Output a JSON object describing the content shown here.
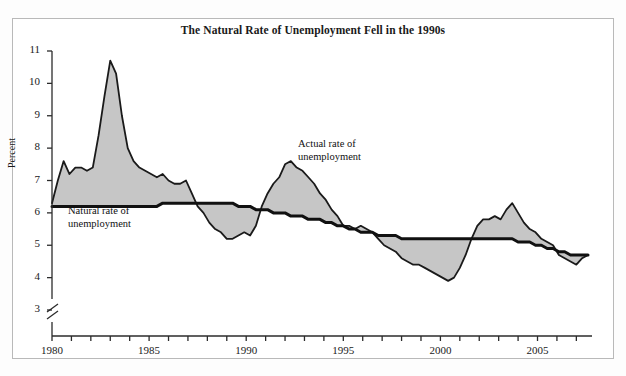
{
  "figure": {
    "width": 626,
    "height": 376,
    "background": "#fdfdfd",
    "border_color": "#b9b9b9"
  },
  "title": "The Natural Rate of Unemployment Fell in the 1990s",
  "axes": {
    "ylabel": "Percent",
    "y_ticks": [
      3,
      4,
      5,
      6,
      7,
      8,
      9,
      10,
      11
    ],
    "y_tick_labels": [
      "3",
      "4",
      "5",
      "6",
      "7",
      "8",
      "9",
      "10",
      "11"
    ],
    "ylim": [
      3,
      11
    ],
    "axis_break": true,
    "x_ticks": [
      1980,
      1981,
      1982,
      1983,
      1984,
      1985,
      1986,
      1987,
      1988,
      1989,
      1990,
      1991,
      1992,
      1993,
      1994,
      1995,
      1996,
      1997,
      1998,
      1999,
      2000,
      2001,
      2002,
      2003,
      2004,
      2005,
      2006,
      2007
    ],
    "x_tick_labels": [
      "1980",
      "1985",
      "1990",
      "1995",
      "2000",
      "2005"
    ],
    "x_labeled_ticks": [
      1980,
      1985,
      1990,
      1995,
      2000,
      2005
    ],
    "xlim": [
      1980,
      2007.6
    ],
    "grid": false
  },
  "annotations": [
    {
      "name": "natural-rate-label",
      "text": "Natural rate of\nunemployment",
      "x": 68,
      "y": 205
    },
    {
      "name": "actual-rate-label",
      "text": "Actual rate of\nunemployment",
      "x": 298,
      "y": 138
    }
  ],
  "colors": {
    "line": "#111111",
    "fill": "#c6c6c6",
    "fill_edge": "#1a1a1a",
    "axis": "#2b2b2b",
    "text": "#1a1a1a"
  },
  "chart_data": {
    "type": "area",
    "title": "The Natural Rate of Unemployment Fell in the 1990s",
    "xlabel": "",
    "ylabel": "Percent",
    "ylim": [
      3,
      11
    ],
    "xlim": [
      1980,
      2007.6
    ],
    "grid": false,
    "legend_position": "inline-annotations",
    "x": [
      1980.0,
      1980.3,
      1980.6,
      1980.9,
      1981.2,
      1981.5,
      1981.8,
      1982.1,
      1982.4,
      1982.7,
      1983.0,
      1983.3,
      1983.6,
      1983.9,
      1984.2,
      1984.5,
      1984.8,
      1985.1,
      1985.4,
      1985.7,
      1986.0,
      1986.3,
      1986.6,
      1986.9,
      1987.2,
      1987.5,
      1987.8,
      1988.1,
      1988.4,
      1988.7,
      1989.0,
      1989.3,
      1989.6,
      1989.9,
      1990.2,
      1990.5,
      1990.8,
      1991.1,
      1991.4,
      1991.7,
      1992.0,
      1992.3,
      1992.6,
      1992.9,
      1993.2,
      1993.5,
      1993.8,
      1994.1,
      1994.4,
      1994.7,
      1995.0,
      1995.3,
      1995.6,
      1995.9,
      1996.2,
      1996.5,
      1996.8,
      1997.1,
      1997.4,
      1997.7,
      1998.0,
      1998.3,
      1998.6,
      1998.9,
      1999.2,
      1999.5,
      1999.8,
      2000.1,
      2000.4,
      2000.7,
      2001.0,
      2001.3,
      2001.6,
      2001.9,
      2002.2,
      2002.5,
      2002.8,
      2003.1,
      2003.4,
      2003.7,
      2004.0,
      2004.3,
      2004.6,
      2004.9,
      2005.2,
      2005.5,
      2005.8,
      2006.1,
      2006.4,
      2006.7,
      2007.0,
      2007.3,
      2007.6
    ],
    "series": [
      {
        "name": "Actual rate of unemployment",
        "values": [
          6.3,
          7.0,
          7.6,
          7.2,
          7.4,
          7.4,
          7.3,
          7.4,
          8.4,
          9.6,
          10.7,
          10.3,
          9.0,
          8.0,
          7.6,
          7.4,
          7.3,
          7.2,
          7.1,
          7.2,
          7.0,
          6.9,
          6.9,
          7.0,
          6.6,
          6.2,
          6.0,
          5.7,
          5.5,
          5.4,
          5.2,
          5.2,
          5.3,
          5.4,
          5.3,
          5.6,
          6.2,
          6.6,
          6.9,
          7.1,
          7.5,
          7.6,
          7.4,
          7.3,
          7.1,
          6.9,
          6.6,
          6.4,
          6.1,
          5.9,
          5.6,
          5.6,
          5.5,
          5.6,
          5.5,
          5.4,
          5.2,
          5.0,
          4.9,
          4.8,
          4.6,
          4.5,
          4.4,
          4.4,
          4.3,
          4.2,
          4.1,
          4.0,
          3.9,
          4.0,
          4.3,
          4.7,
          5.2,
          5.6,
          5.8,
          5.8,
          5.9,
          5.8,
          6.1,
          6.3,
          6.0,
          5.7,
          5.5,
          5.4,
          5.2,
          5.1,
          5.0,
          4.7,
          4.6,
          4.5,
          4.4,
          4.6,
          4.7
        ]
      },
      {
        "name": "Natural rate of unemployment",
        "values": [
          6.2,
          6.2,
          6.2,
          6.2,
          6.2,
          6.2,
          6.2,
          6.2,
          6.2,
          6.2,
          6.2,
          6.2,
          6.2,
          6.2,
          6.2,
          6.2,
          6.2,
          6.2,
          6.2,
          6.3,
          6.3,
          6.3,
          6.3,
          6.3,
          6.3,
          6.3,
          6.3,
          6.3,
          6.3,
          6.3,
          6.3,
          6.3,
          6.2,
          6.2,
          6.2,
          6.1,
          6.1,
          6.1,
          6.0,
          6.0,
          6.0,
          5.9,
          5.9,
          5.9,
          5.8,
          5.8,
          5.8,
          5.7,
          5.7,
          5.6,
          5.6,
          5.5,
          5.5,
          5.4,
          5.4,
          5.4,
          5.3,
          5.3,
          5.3,
          5.3,
          5.2,
          5.2,
          5.2,
          5.2,
          5.2,
          5.2,
          5.2,
          5.2,
          5.2,
          5.2,
          5.2,
          5.2,
          5.2,
          5.2,
          5.2,
          5.2,
          5.2,
          5.2,
          5.2,
          5.2,
          5.1,
          5.1,
          5.1,
          5.0,
          5.0,
          4.9,
          4.9,
          4.8,
          4.8,
          4.7,
          4.7,
          4.7,
          4.7
        ]
      }
    ]
  }
}
